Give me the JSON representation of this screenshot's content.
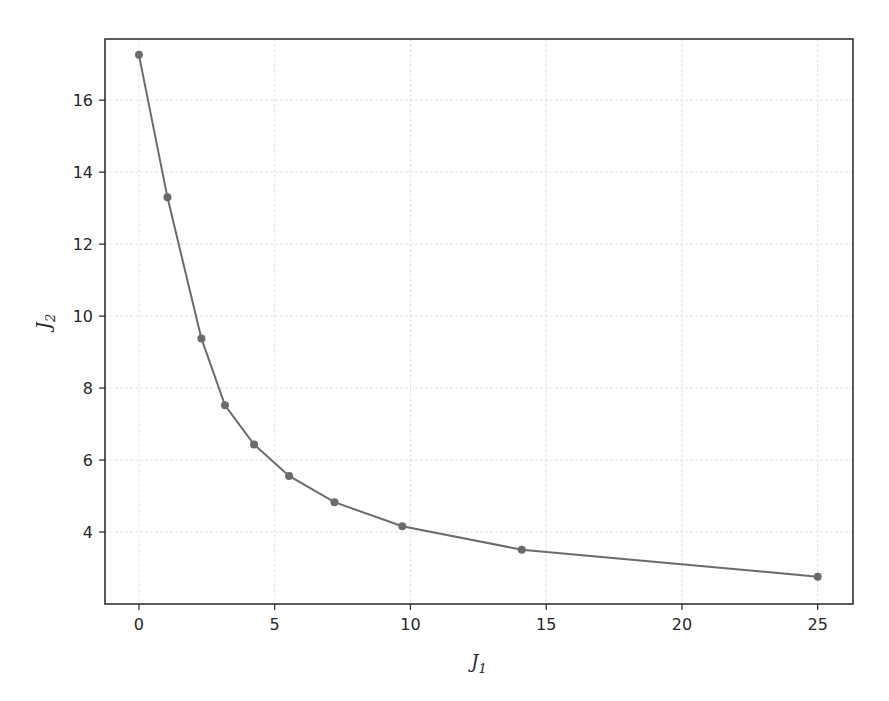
{
  "chart_data": {
    "type": "line",
    "title": "",
    "xlabel": "J1",
    "ylabel": "J2",
    "xlabel_main": "J",
    "xlabel_sub": "1",
    "ylabel_main": "J",
    "ylabel_sub": "2",
    "xlim": [
      -1.25,
      26.3
    ],
    "ylim": [
      2.0,
      17.7
    ],
    "xticks": [
      0,
      5,
      10,
      15,
      20,
      25
    ],
    "yticks": [
      4,
      6,
      8,
      10,
      12,
      14,
      16
    ],
    "grid": true,
    "legend": null,
    "series": [
      {
        "name": "Pareto front",
        "color": "#6b6b6b",
        "marker": "circle",
        "x": [
          0.0,
          1.05,
          2.3,
          3.17,
          4.24,
          5.53,
          7.2,
          9.7,
          14.1,
          25.0
        ],
        "y": [
          17.26,
          13.3,
          9.38,
          7.52,
          6.43,
          5.56,
          4.83,
          4.16,
          3.51,
          2.76
        ]
      }
    ]
  },
  "style": {
    "line_color": "#6b6b6b",
    "grid_color": "#d9d9d9",
    "axis_color": "#262626",
    "background": "#ffffff"
  }
}
